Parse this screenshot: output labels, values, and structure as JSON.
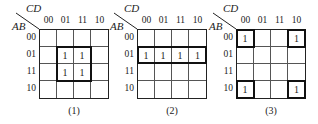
{
  "maps": [
    {
      "id": "1",
      "row_var": "AB",
      "col_var": "CD",
      "col_labels": [
        "00",
        "01",
        "11",
        "10"
      ],
      "row_labels": [
        "00",
        "01",
        "11",
        "10"
      ],
      "cells": [
        [
          "",
          "",
          "",
          ""
        ],
        [
          "",
          "1",
          "1",
          ""
        ],
        [
          "",
          "1",
          "1",
          ""
        ],
        [
          "",
          "",
          "",
          ""
        ]
      ],
      "caption": "(1)"
    },
    {
      "id": "2",
      "row_var": "AB",
      "col_var": "CD",
      "col_labels": [
        "00",
        "01",
        "11",
        "10"
      ],
      "row_labels": [
        "00",
        "01",
        "11",
        "10"
      ],
      "cells": [
        [
          "",
          "",
          "",
          ""
        ],
        [
          "1",
          "1",
          "1",
          "1"
        ],
        [
          "",
          "",
          "",
          ""
        ],
        [
          "",
          "",
          "",
          ""
        ]
      ],
      "caption": "(2)"
    },
    {
      "id": "3",
      "row_var": "AB",
      "col_var": "CD",
      "col_labels": [
        "00",
        "01",
        "11",
        "10"
      ],
      "row_labels": [
        "00",
        "01",
        "11",
        "10"
      ],
      "cells": [
        [
          "1",
          "",
          "",
          "1"
        ],
        [
          "",
          "",
          "",
          ""
        ],
        [
          "",
          "",
          "",
          ""
        ],
        [
          "1",
          "",
          "",
          "1"
        ]
      ],
      "caption": "(3)"
    }
  ]
}
